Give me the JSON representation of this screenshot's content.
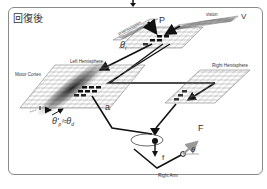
{
  "panel": {
    "title": "回復後"
  },
  "labels": {
    "proprioception": "proprioception",
    "P": "P",
    "vision": "vision",
    "V": "V",
    "theta_i": "θ",
    "theta_i_sub": "i",
    "left_hemisphere": "Left Hemisphere",
    "right_hemisphere": "Right Hemisphere",
    "motor_cortex": "Motor Cortex",
    "a": "a",
    "f": "f",
    "F": "F",
    "theta": "θ",
    "right_arm": "Right Arm",
    "equation": "θ'p≈θd",
    "eq_theta_p": "θ'",
    "eq_p_sub": "p",
    "eq_approx": "≈θ",
    "eq_d_sub": "d"
  },
  "colors": {
    "line": "#1a1a1a",
    "grid": "#777777",
    "arrow_gray": "#9a9a9a",
    "frame": "#8a8a8a"
  }
}
